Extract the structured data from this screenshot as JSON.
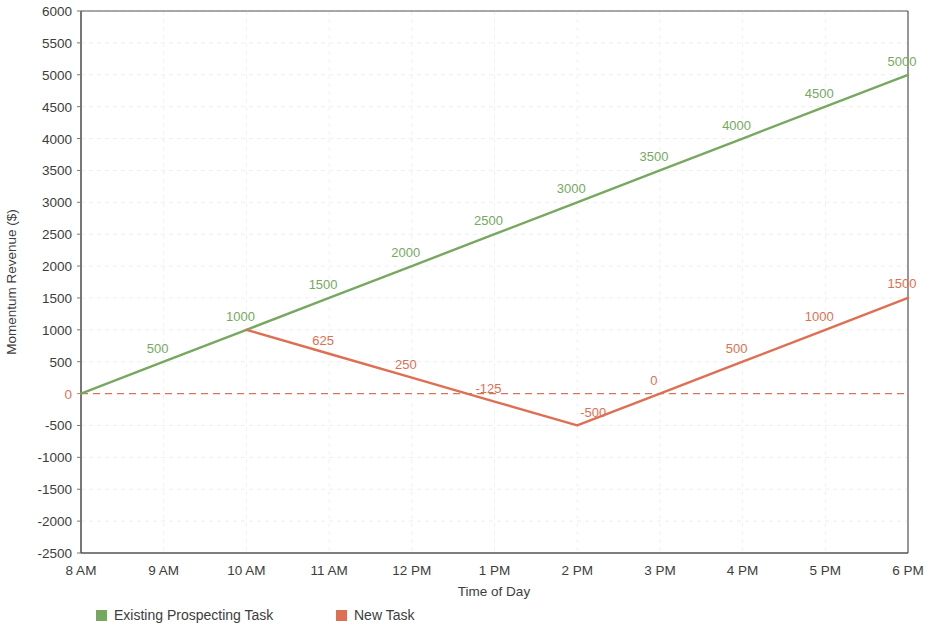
{
  "chart_data": {
    "type": "line",
    "title": "",
    "xlabel": "Time of Day",
    "ylabel": "Momentum Revenue ($)",
    "x": [
      "8 AM",
      "9 AM",
      "10 AM",
      "11 AM",
      "12 PM",
      "1 PM",
      "2 PM",
      "3 PM",
      "4 PM",
      "5 PM",
      "6 PM"
    ],
    "categories": [
      "8 AM",
      "9 AM",
      "10 AM",
      "11 AM",
      "12 PM",
      "1 PM",
      "2 PM",
      "3 PM",
      "4 PM",
      "5 PM",
      "6 PM"
    ],
    "ylim": [
      -2500,
      6000
    ],
    "ytick_labels": [
      "6000",
      "5500",
      "5000",
      "4500",
      "4000",
      "3500",
      "3000",
      "2500",
      "2000",
      "1500",
      "1000",
      "500",
      "0",
      "-500",
      "-1000",
      "-1500",
      "-2000",
      "-2500"
    ],
    "ytick_values": [
      6000,
      5500,
      5000,
      4500,
      4000,
      3500,
      3000,
      2500,
      2000,
      1500,
      1000,
      500,
      0,
      -500,
      -1000,
      -1500,
      -2000,
      -2500
    ],
    "ytick_interval": 500,
    "grid": true,
    "legend_position": "bottom",
    "zero_reference_line": {
      "value": 0,
      "style": "dashed",
      "color": "#e0725a"
    },
    "series": [
      {
        "name": "Existing Prospecting Task",
        "color": "#76a95f",
        "x": [
          "8 AM",
          "9 AM",
          "10 AM",
          "11 AM",
          "12 PM",
          "1 PM",
          "2 PM",
          "3 PM",
          "4 PM",
          "5 PM",
          "6 PM"
        ],
        "values": [
          0,
          500,
          1000,
          1500,
          2000,
          2500,
          3000,
          3500,
          4000,
          4500,
          5000
        ],
        "labels": [
          "",
          "500",
          "1000",
          "1500",
          "2000",
          "2500",
          "3000",
          "3500",
          "4000",
          "4500",
          "5000"
        ]
      },
      {
        "name": "New Task",
        "color": "#df6f52",
        "x": [
          "10 AM",
          "11 AM",
          "12 PM",
          "1 PM",
          "2 PM",
          "3 PM",
          "4 PM",
          "5 PM",
          "6 PM"
        ],
        "values": [
          1000,
          625,
          250,
          -125,
          -500,
          0,
          500,
          1000,
          1500
        ],
        "labels": [
          "",
          "625",
          "250",
          "-125",
          "-500",
          "0",
          "500",
          "1000",
          "1500"
        ]
      }
    ]
  },
  "legend": {
    "items": [
      {
        "label": "Existing Prospecting Task",
        "color": "#76a95f"
      },
      {
        "label": "New Task",
        "color": "#df6f52"
      }
    ]
  },
  "axis": {
    "x_title": "Time of Day",
    "y_title": "Momentum Revenue ($)"
  }
}
